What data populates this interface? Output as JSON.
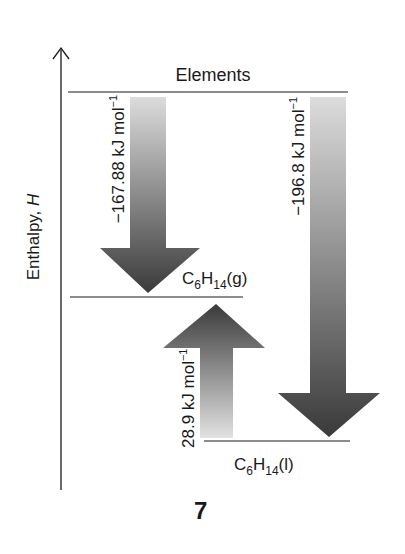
{
  "diagram": {
    "type": "enthalpy-level-diagram",
    "axis": {
      "label_prefix": "Enthalpy, ",
      "label_symbol": "H"
    },
    "levels": {
      "elements": {
        "label": "Elements"
      },
      "gas": {
        "formula_c": "C",
        "formula_c_sub": "6",
        "formula_h": "H",
        "formula_h_sub": "14",
        "state": "(g)"
      },
      "liquid": {
        "formula_c": "C",
        "formula_h": "H",
        "formula_c_sub": "6",
        "formula_h_sub": "14",
        "state": "(l)"
      }
    },
    "arrows": {
      "elements_to_gas": {
        "value": "−167.88 kJ mol",
        "exp": "−1"
      },
      "liquid_to_gas": {
        "value": "28.9 kJ mol",
        "exp": "−1"
      },
      "elements_to_liquid": {
        "value": "−196.8 kJ mol",
        "exp": "−1"
      }
    },
    "figure_number": "7",
    "colors": {
      "arrow_dark": "#3c3c3c",
      "arrow_light": "#d8d8d8",
      "line": "#1a1a1a"
    }
  }
}
